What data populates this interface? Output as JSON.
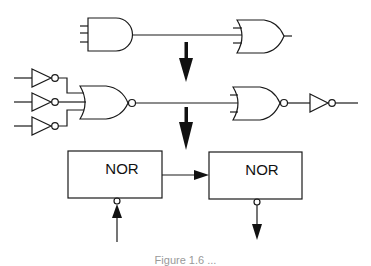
{
  "diagram": {
    "type": "logic-gate-transformation",
    "stages": [
      {
        "id": "stage-1",
        "description": "3-input AND gate driving 3-input OR gate",
        "gates": [
          "AND",
          "OR"
        ]
      },
      {
        "id": "stage-2",
        "description": "Inverted inputs into NOR gate driving NOR gate followed by inverter",
        "gates": [
          "NOT",
          "NOT",
          "NOT",
          "NOR",
          "NOR",
          "NOT"
        ]
      },
      {
        "id": "stage-3",
        "description": "Block form: NOR block with inverted input feeding NOR block with inverted output",
        "gates": [
          "NOR",
          "NOR"
        ]
      }
    ],
    "blocks": [
      {
        "label": "NOR"
      },
      {
        "label": "NOR"
      }
    ],
    "caption": "Figure 1.6 ..."
  },
  "colors": {
    "stroke": "#1a1a1a",
    "background": "#ffffff"
  }
}
